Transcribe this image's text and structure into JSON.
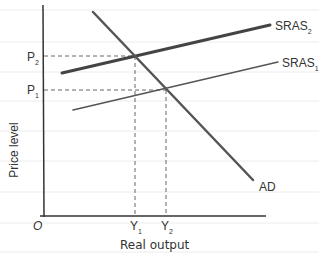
{
  "diagram": {
    "title": "",
    "axes": {
      "x_label": "Real output",
      "y_label": "Price level",
      "origin_label": "O"
    },
    "curves": [
      {
        "name": "AD",
        "label": "AD"
      },
      {
        "name": "SRAS1",
        "label": "SRAS",
        "subscript": "1"
      },
      {
        "name": "SRAS2",
        "label": "SRAS",
        "subscript": "2"
      }
    ],
    "price_levels": [
      {
        "label": "P",
        "subscript": "2"
      },
      {
        "label": "P",
        "subscript": "1"
      }
    ],
    "output_levels": [
      {
        "label": "Y",
        "subscript": "1"
      },
      {
        "label": "Y",
        "subscript": "2"
      }
    ],
    "colors": {
      "axis": "#333333",
      "curve": "#555555",
      "guide": "#666666",
      "ruled_line": "#ececec"
    }
  }
}
